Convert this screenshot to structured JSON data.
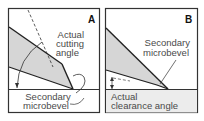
{
  "figure": {
    "panels": [
      {
        "id": "A",
        "letter": "A",
        "labels": {
          "cutting_angle_line1": "Actual",
          "cutting_angle_line2": "cutting",
          "cutting_angle_line3": "angle",
          "bevel_line1": "Secondary",
          "bevel_line2": "microbevel"
        }
      },
      {
        "id": "B",
        "letter": "B",
        "labels": {
          "bevel_line1": "Secondary",
          "bevel_line2": "microbevel",
          "clearance_line1": "Actual",
          "clearance_line2": "clearance angle"
        }
      }
    ],
    "colors": {
      "blade_fill": "#d6d6d6",
      "line": "#222222",
      "border": "#333333",
      "text": "#4a4a4a"
    }
  }
}
